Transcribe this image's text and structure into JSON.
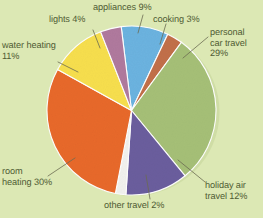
{
  "chart_data": {
    "type": "pie",
    "title": "",
    "subtitle": "",
    "xlabel": "",
    "ylabel": "",
    "grid": false,
    "legend_position": "none",
    "label_format": "name percent",
    "background_color": "#dce8b4",
    "text_color": "#4f5b33",
    "leader_line_color": "#6b6b52",
    "start_angle_deg": -7,
    "categories": [
      "appliances",
      "cooking",
      "personal car travel",
      "holiday air travel",
      "other travel",
      "room heating",
      "water heating",
      "lights"
    ],
    "values": [
      9,
      3,
      29,
      12,
      2,
      30,
      11,
      4
    ],
    "units": "%",
    "total": 100,
    "colors": [
      "#6cb3e0",
      "#c2704a",
      "#a6c077",
      "#6b5e9e",
      "#f2f2ee",
      "#e8692a",
      "#f7df4e",
      "#b07a9e"
    ],
    "slices": [
      {
        "name": "appliances",
        "value": 9,
        "color": "#6cb3e0",
        "label": "appliances 9%"
      },
      {
        "name": "cooking",
        "value": 3,
        "color": "#c2704a",
        "label": "cooking 3%"
      },
      {
        "name": "personal car travel",
        "value": 29,
        "color": "#a6c077",
        "label": "personal car travel 29%"
      },
      {
        "name": "holiday air travel",
        "value": 12,
        "color": "#6b5e9e",
        "label": "holiday air travel 12%"
      },
      {
        "name": "other travel",
        "value": 2,
        "color": "#f2f2ee",
        "label": "other travel 2%"
      },
      {
        "name": "room heating",
        "value": 30,
        "color": "#e8692a",
        "label": "room heating 30%"
      },
      {
        "name": "water heating",
        "value": 11,
        "color": "#f7df4e",
        "label": "water heating 11%"
      },
      {
        "name": "lights",
        "value": 4,
        "color": "#b07a9e",
        "label": "lights 4%"
      }
    ]
  },
  "labels": {
    "appliances": "appliances 9%",
    "cooking": "cooking 3%",
    "personal_car_travel": "personal\ncar travel\n29%",
    "holiday_air_travel": "holiday air\ntravel 12%",
    "other_travel": "other travel 2%",
    "room_heating": "room\nheating 30%",
    "water_heating": "water heating\n11%",
    "lights": "lights 4%"
  }
}
